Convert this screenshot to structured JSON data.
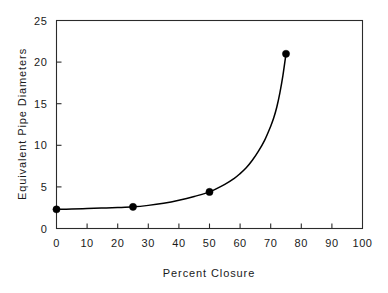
{
  "chart_data": {
    "type": "line",
    "title": "",
    "xlabel": "Percent  Closure",
    "ylabel": "Equivalent  Pipe  Diameters",
    "xlim": [
      0,
      100
    ],
    "ylim": [
      0,
      25
    ],
    "xticks": [
      0,
      10,
      20,
      30,
      40,
      50,
      60,
      70,
      80,
      90,
      100
    ],
    "xtick_labels": [
      "0",
      "10",
      "20",
      "30",
      "40",
      "50",
      "60",
      "70",
      "80",
      "90",
      "100"
    ],
    "yticks": [
      0,
      5,
      10,
      15,
      20,
      25
    ],
    "ytick_labels": [
      "0",
      "5",
      "10",
      "15",
      "20",
      "25"
    ],
    "grid": false,
    "legend": false,
    "series": [
      {
        "name": "Equivalent Pipe Diameters",
        "marker": "filled-circle",
        "marker_color": "#000000",
        "line_color": "#000000",
        "x": [
          0,
          25,
          50,
          75
        ],
        "values": [
          2.3,
          2.6,
          4.4,
          21.0
        ]
      }
    ],
    "curve_points": [
      [
        0,
        2.3
      ],
      [
        5,
        2.34
      ],
      [
        10,
        2.4
      ],
      [
        15,
        2.46
      ],
      [
        20,
        2.52
      ],
      [
        25,
        2.6
      ],
      [
        30,
        2.78
      ],
      [
        35,
        3.04
      ],
      [
        40,
        3.4
      ],
      [
        45,
        3.85
      ],
      [
        50,
        4.4
      ],
      [
        55,
        5.3
      ],
      [
        58,
        6.0
      ],
      [
        60,
        6.6
      ],
      [
        62,
        7.3
      ],
      [
        64,
        8.2
      ],
      [
        66,
        9.3
      ],
      [
        68,
        10.6
      ],
      [
        70,
        12.3
      ],
      [
        71,
        13.3
      ],
      [
        72,
        14.6
      ],
      [
        73,
        16.3
      ],
      [
        74,
        18.4
      ],
      [
        75,
        21.0
      ]
    ]
  },
  "figure": {
    "background_color": "#ffffff",
    "axis_color": "#2b2b2b",
    "text_color": "#1a1a1a"
  }
}
